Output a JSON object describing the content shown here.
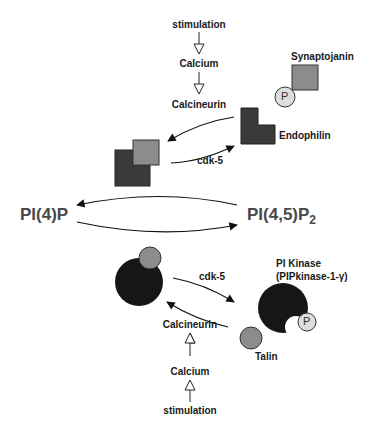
{
  "diagram": {
    "top_pathway": {
      "steps": [
        "stimulation",
        "Calcium",
        "Calcineurin"
      ],
      "synaptojanin_label": "Synaptojanin",
      "endophilin_label": "Endophilin",
      "phospho_label": "P",
      "kinase_label": "cdk-5"
    },
    "center": {
      "left_lipid": "PI(4)P",
      "right_lipid_main": "PI(4,5)P",
      "right_lipid_subscript": "2"
    },
    "bottom_pathway": {
      "steps": [
        "Calcineurin",
        "Calcium",
        "stimulation"
      ],
      "pi_kinase_label": "PI Kinase",
      "pi_kinase_sublabel": "(PIPkinase-1-γ)",
      "talin_label": "Talin",
      "phospho_label": "P",
      "kinase_label": "cdk-5"
    },
    "colors": {
      "dark_protein": "#3a3a3a",
      "light_protein": "#8c8c8c",
      "black_protein": "#161616",
      "phospho_fill": "#dddddd",
      "lipid_text": "#4a4a4a"
    }
  }
}
